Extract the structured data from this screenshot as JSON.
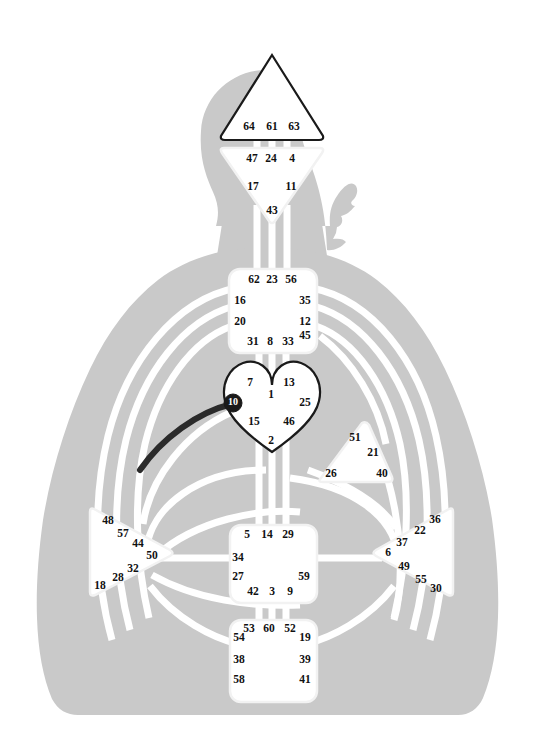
{
  "chart": {
    "type": "diagram",
    "colors": {
      "body": "#c9c9c9",
      "background": "#ffffff",
      "center_undefined_fill": "#ffffff",
      "center_undefined_stroke": "#f2f2f2",
      "center_defined_stroke": "#1a1a1a",
      "channel_open": "#ffffff",
      "channel_defined": "#2b2b2b",
      "gate_text": "#111111",
      "activated_gate_text": "#ffffff"
    }
  },
  "centers": [
    {
      "id": "head",
      "name": "Head",
      "shape": "triangle-up",
      "defined": true,
      "gates": [
        {
          "num": "64",
          "x": 249,
          "y": 127
        },
        {
          "num": "61",
          "x": 272,
          "y": 127
        },
        {
          "num": "63",
          "x": 294,
          "y": 127
        }
      ]
    },
    {
      "id": "ajna",
      "name": "Ajna",
      "shape": "triangle-down",
      "defined": false,
      "gates": [
        {
          "num": "47",
          "x": 252,
          "y": 159
        },
        {
          "num": "24",
          "x": 271,
          "y": 159
        },
        {
          "num": "4",
          "x": 292,
          "y": 159
        },
        {
          "num": "17",
          "x": 253,
          "y": 187
        },
        {
          "num": "11",
          "x": 291,
          "y": 187
        },
        {
          "num": "43",
          "x": 272,
          "y": 211
        }
      ]
    },
    {
      "id": "throat",
      "name": "Throat",
      "shape": "square",
      "defined": false,
      "gates": [
        {
          "num": "62",
          "x": 254,
          "y": 280
        },
        {
          "num": "23",
          "x": 272,
          "y": 280
        },
        {
          "num": "56",
          "x": 291,
          "y": 280
        },
        {
          "num": "16",
          "x": 240,
          "y": 301
        },
        {
          "num": "35",
          "x": 305,
          "y": 301
        },
        {
          "num": "20",
          "x": 240,
          "y": 322
        },
        {
          "num": "12",
          "x": 305,
          "y": 322
        },
        {
          "num": "31",
          "x": 253,
          "y": 342
        },
        {
          "num": "8",
          "x": 270,
          "y": 342
        },
        {
          "num": "33",
          "x": 288,
          "y": 342
        },
        {
          "num": "45",
          "x": 305,
          "y": 336
        }
      ]
    },
    {
      "id": "g-center",
      "name": "G Center / Identity",
      "shape": "heart",
      "defined": true,
      "gates": [
        {
          "num": "7",
          "x": 250,
          "y": 383
        },
        {
          "num": "13",
          "x": 289,
          "y": 383
        },
        {
          "num": "1",
          "x": 271,
          "y": 395
        },
        {
          "num": "10",
          "x": 233,
          "y": 403,
          "activated": true
        },
        {
          "num": "25",
          "x": 305,
          "y": 403
        },
        {
          "num": "15",
          "x": 254,
          "y": 422
        },
        {
          "num": "46",
          "x": 289,
          "y": 422
        },
        {
          "num": "2",
          "x": 271,
          "y": 441
        }
      ]
    },
    {
      "id": "heart",
      "name": "Heart / Ego / Will",
      "shape": "triangle-right",
      "defined": false,
      "gates": [
        {
          "num": "51",
          "x": 355,
          "y": 438
        },
        {
          "num": "21",
          "x": 373,
          "y": 453
        },
        {
          "num": "26",
          "x": 331,
          "y": 474
        },
        {
          "num": "40",
          "x": 382,
          "y": 474
        }
      ]
    },
    {
      "id": "spleen",
      "name": "Spleen",
      "shape": "triangle-right-pointing",
      "defined": false,
      "gates": [
        {
          "num": "48",
          "x": 108,
          "y": 521
        },
        {
          "num": "57",
          "x": 123,
          "y": 534
        },
        {
          "num": "44",
          "x": 138,
          "y": 544
        },
        {
          "num": "50",
          "x": 152,
          "y": 556
        },
        {
          "num": "32",
          "x": 133,
          "y": 569
        },
        {
          "num": "28",
          "x": 118,
          "y": 578
        },
        {
          "num": "18",
          "x": 100,
          "y": 586
        }
      ]
    },
    {
      "id": "sacral",
      "name": "Sacral",
      "shape": "square",
      "defined": false,
      "gates": [
        {
          "num": "5",
          "x": 247,
          "y": 535
        },
        {
          "num": "14",
          "x": 267,
          "y": 535
        },
        {
          "num": "29",
          "x": 288,
          "y": 535
        },
        {
          "num": "34",
          "x": 238,
          "y": 558
        },
        {
          "num": "27",
          "x": 238,
          "y": 577
        },
        {
          "num": "59",
          "x": 304,
          "y": 577
        },
        {
          "num": "42",
          "x": 253,
          "y": 592
        },
        {
          "num": "3",
          "x": 272,
          "y": 592
        },
        {
          "num": "9",
          "x": 290,
          "y": 592
        }
      ]
    },
    {
      "id": "solar-plexus",
      "name": "Solar Plexus",
      "shape": "triangle-left-pointing",
      "defined": false,
      "gates": [
        {
          "num": "36",
          "x": 435,
          "y": 520
        },
        {
          "num": "22",
          "x": 420,
          "y": 531
        },
        {
          "num": "37",
          "x": 402,
          "y": 543
        },
        {
          "num": "6",
          "x": 388,
          "y": 553
        },
        {
          "num": "49",
          "x": 404,
          "y": 567
        },
        {
          "num": "55",
          "x": 421,
          "y": 580
        },
        {
          "num": "30",
          "x": 436,
          "y": 589
        }
      ]
    },
    {
      "id": "root",
      "name": "Root",
      "shape": "square",
      "defined": false,
      "gates": [
        {
          "num": "53",
          "x": 249,
          "y": 629
        },
        {
          "num": "60",
          "x": 269,
          "y": 629
        },
        {
          "num": "52",
          "x": 290,
          "y": 629
        },
        {
          "num": "54",
          "x": 239,
          "y": 638
        },
        {
          "num": "19",
          "x": 305,
          "y": 638
        },
        {
          "num": "38",
          "x": 239,
          "y": 660
        },
        {
          "num": "39",
          "x": 305,
          "y": 660
        },
        {
          "num": "58",
          "x": 239,
          "y": 680
        },
        {
          "num": "41",
          "x": 305,
          "y": 680
        }
      ]
    }
  ],
  "defined_channels": [
    {
      "id": "channel-10-57",
      "from_gate": "10",
      "to_gate": "57",
      "color": "#2b2b2b"
    }
  ],
  "activated_gates": [
    "10"
  ]
}
